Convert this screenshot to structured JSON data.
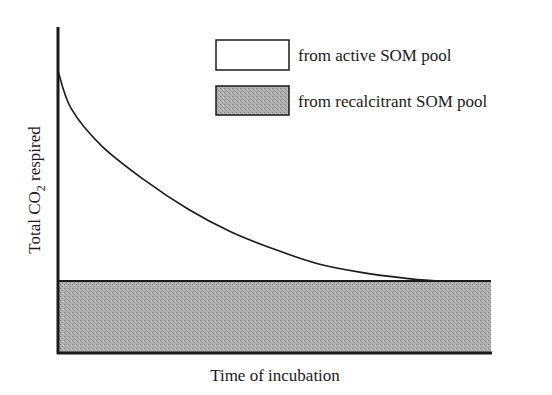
{
  "chart_data": {
    "type": "area",
    "title": "",
    "xlabel": "Time of incubation",
    "ylabel_main": "Total CO",
    "ylabel_sub": "2",
    "ylabel_rest": " respired",
    "xlim": [
      0,
      1
    ],
    "ylim": [
      0,
      1
    ],
    "grid": false,
    "ticks": false,
    "legend_position": "top-right",
    "series": [
      {
        "name": "from active SOM pool",
        "fill": "#ffffff",
        "x": [
          0,
          0.03,
          0.1,
          0.2,
          0.3,
          0.4,
          0.5,
          0.6,
          0.7,
          0.8,
          0.88,
          1.0
        ],
        "y": [
          0.98,
          0.85,
          0.72,
          0.6,
          0.5,
          0.42,
          0.36,
          0.31,
          0.28,
          0.26,
          0.25,
          0.25
        ]
      },
      {
        "name": "from recalcitrant SOM pool",
        "fill": "#a8a8a8",
        "x": [
          0,
          1.0
        ],
        "y": [
          0.25,
          0.25
        ]
      }
    ]
  }
}
